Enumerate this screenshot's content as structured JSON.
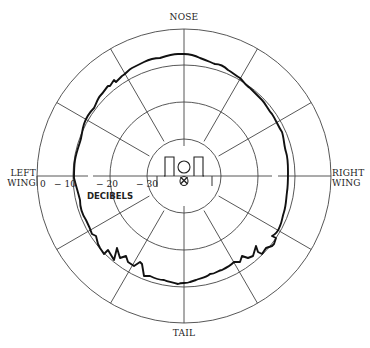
{
  "diagram": {
    "type": "polar radiation pattern",
    "labels": {
      "nose": "NOSE",
      "tail": "TAIL",
      "left_wing_1": "LEFT",
      "left_wing_2": "WING",
      "right_wing_1": "RIGHT",
      "right_wing_2": "WING",
      "units": "DECIBELS"
    },
    "scale_ticks": [
      "0",
      "− 10",
      "− 20",
      "− 30"
    ],
    "rings_db": [
      0,
      -10,
      -20,
      -30
    ],
    "spoke_angle_step_deg": 30,
    "colors": {
      "grid": "#444444",
      "pattern": "#111111",
      "background": "#ffffff"
    }
  }
}
